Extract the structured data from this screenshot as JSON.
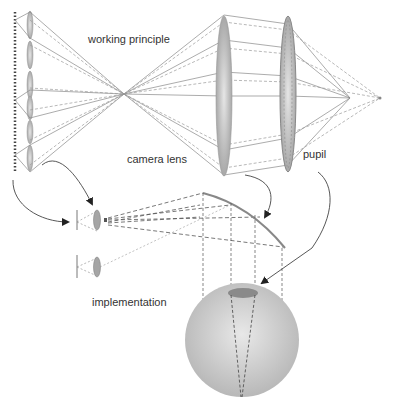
{
  "labels": {
    "working_principle": "working principle",
    "camera_lens": "camera lens",
    "pupil": "pupil",
    "implementation": "implementation"
  },
  "colors": {
    "line": "#888888",
    "lens_fill": "#b0b0b0",
    "lens_dark": "#8a8a8a",
    "sphere": "#c4c4c4",
    "arrow": "#444444",
    "text": "#333333"
  },
  "components": {
    "lens_array": "micro-lens array",
    "camera_lens": "camera lens",
    "pupil": "pupil",
    "focal_point": "image point",
    "eye_sphere": "eye sphere",
    "curved_screen": "curved screen"
  }
}
